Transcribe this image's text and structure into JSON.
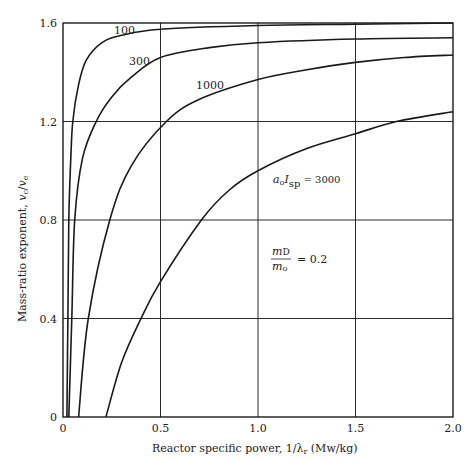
{
  "chart_data": {
    "type": "line",
    "title": "",
    "xlabel": "Reactor specific power, 1/λr (Mw/kg)",
    "ylabel": "Mass-ratio exponent, vc/ve",
    "xlim": [
      0,
      2.0
    ],
    "ylim": [
      0,
      1.6
    ],
    "grid": true,
    "legend": "none (curves labeled inline)",
    "x_ticks": [
      "0",
      "0.5",
      "1.0",
      "1.5",
      "2.0"
    ],
    "y_ticks": [
      "0",
      "0.4",
      "0.8",
      "1.2",
      "1.6"
    ],
    "parameter_label": "a0 Isp",
    "series": [
      {
        "name": "100",
        "x": [
          0.02,
          0.025,
          0.03,
          0.04,
          0.05,
          0.08,
          0.12,
          0.2,
          0.3,
          0.5,
          1.0,
          1.5,
          2.0
        ],
        "y": [
          0,
          0.4,
          0.8,
          1.05,
          1.2,
          1.35,
          1.45,
          1.52,
          1.55,
          1.575,
          1.59,
          1.595,
          1.6
        ]
      },
      {
        "name": "300",
        "x": [
          0.03,
          0.045,
          0.06,
          0.1,
          0.17,
          0.25,
          0.35,
          0.5,
          0.75,
          1.0,
          1.5,
          2.0
        ],
        "y": [
          0,
          0.4,
          0.8,
          1.05,
          1.2,
          1.3,
          1.38,
          1.46,
          1.5,
          1.52,
          1.535,
          1.54
        ]
      },
      {
        "name": "1000",
        "x": [
          0.08,
          0.13,
          0.24,
          0.35,
          0.53,
          0.7,
          1.0,
          1.25,
          1.5,
          1.75,
          2.0
        ],
        "y": [
          0,
          0.4,
          0.8,
          1.02,
          1.2,
          1.29,
          1.37,
          1.41,
          1.44,
          1.46,
          1.47
        ]
      },
      {
        "name": "3000",
        "x": [
          0.22,
          0.3,
          0.4,
          0.5,
          0.71,
          0.85,
          1.0,
          1.25,
          1.5,
          1.71,
          2.0
        ],
        "y": [
          0,
          0.22,
          0.4,
          0.55,
          0.8,
          0.92,
          1.0,
          1.09,
          1.15,
          1.2,
          1.24
        ]
      }
    ],
    "annotations": [
      {
        "text": "a0 Isp = 3000",
        "x": 1.07,
        "y": 0.92
      },
      {
        "text": "mD/m0 = 0.2",
        "x": 1.07,
        "y": 0.62
      }
    ]
  },
  "labels": {
    "y_axis_main": "Mass-ratio exponent, ",
    "y_axis_var_num": "v",
    "y_axis_sub_num": "c",
    "y_axis_slash": "/",
    "y_axis_var_den": "v",
    "y_axis_sub_den": "e",
    "x_axis_main": "Reactor specific power, 1/λ",
    "x_axis_sub": "r",
    "x_axis_units": " (Mw/kg)",
    "curve_100": "100",
    "curve_300": "300",
    "curve_1000": "1000",
    "annot_a": "a",
    "annot_a_sub": "o",
    "annot_I": "I",
    "annot_I_sub": "sp",
    "annot_eq": " = 3000",
    "frac_num": "m",
    "frac_num_sub": "D",
    "frac_den": "m",
    "frac_den_sub": "o",
    "frac_eq": "= 0.2"
  }
}
